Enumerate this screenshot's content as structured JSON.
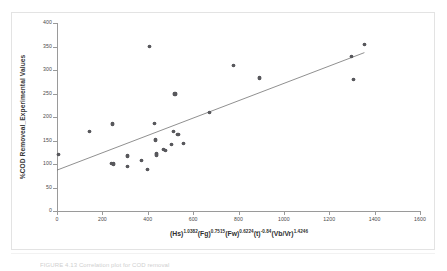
{
  "figure": {
    "caption_partial": "FIGURE 4.13   Correlation plot for COD removal",
    "axis_title_y": "%COD Removeal_Experimental Values",
    "axis_title_x_parts": [
      {
        "base": "(Hs)",
        "exp": "1.0382"
      },
      {
        "base": "(Fg)",
        "exp": "0.7515"
      },
      {
        "base": "(Fw)",
        "exp": "0.6224"
      },
      {
        "base": "(t)",
        "exp": "-0.84"
      },
      {
        "base": "(Vb/Vr)",
        "exp": "1.4246"
      }
    ],
    "axis_title_x_plain": "(Hs)1.0382(Fg)0.7515(Fw)0.6224(t)-0.84(Vb/Vr)1.4246"
  },
  "colors": {
    "marker": "#58585c",
    "trendline": "#6b6b6b",
    "axis": "#9a9a9a",
    "frame": "#e3e3e3",
    "background": "#ffffff",
    "text": "#3a3a3a"
  },
  "chart_data": {
    "type": "scatter",
    "title": "",
    "subtitle": "",
    "xlabel": "(Hs)^1.0382(Fg)^0.7515(Fw)^0.6224(t)^-0.84(Vb/Vr)^1.4246",
    "ylabel": "%COD Removeal_Experimental Values",
    "xlim": [
      0,
      1600
    ],
    "ylim": [
      0,
      400
    ],
    "xticks": [
      0,
      200,
      400,
      600,
      800,
      1000,
      1200,
      1400,
      1600
    ],
    "yticks": [
      0,
      50,
      100,
      150,
      200,
      250,
      300,
      350,
      400
    ],
    "grid": false,
    "legend": null,
    "legend_position": "none",
    "series": [
      {
        "name": "Experimental vs correlation",
        "marker": "diamond",
        "points": [
          {
            "x": 5,
            "y": 120
          },
          {
            "x": 143,
            "y": 170
          },
          {
            "x": 243,
            "y": 185
          },
          {
            "x": 240,
            "y": 101
          },
          {
            "x": 248,
            "y": 100
          },
          {
            "x": 310,
            "y": 117
          },
          {
            "x": 312,
            "y": 95
          },
          {
            "x": 372,
            "y": 107
          },
          {
            "x": 398,
            "y": 88
          },
          {
            "x": 406,
            "y": 350
          },
          {
            "x": 430,
            "y": 187
          },
          {
            "x": 434,
            "y": 151
          },
          {
            "x": 437,
            "y": 123
          },
          {
            "x": 440,
            "y": 119
          },
          {
            "x": 470,
            "y": 131
          },
          {
            "x": 480,
            "y": 128
          },
          {
            "x": 505,
            "y": 141
          },
          {
            "x": 512,
            "y": 170
          },
          {
            "x": 520,
            "y": 249
          },
          {
            "x": 533,
            "y": 163
          },
          {
            "x": 556,
            "y": 144
          },
          {
            "x": 672,
            "y": 209
          },
          {
            "x": 779,
            "y": 310
          },
          {
            "x": 893,
            "y": 283
          },
          {
            "x": 1297,
            "y": 328
          },
          {
            "x": 1307,
            "y": 279
          },
          {
            "x": 1355,
            "y": 354
          }
        ]
      }
    ],
    "trendline": {
      "type": "linear",
      "x_start": 0,
      "y_start": 87,
      "x_end": 1355,
      "y_end": 337
    }
  }
}
